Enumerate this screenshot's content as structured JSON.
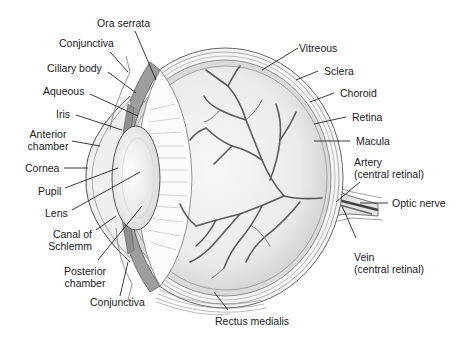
{
  "diagram": {
    "labels_left": {
      "ora_serrata": "Ora serrata",
      "conjunctiva_top": "Conjunctiva",
      "ciliary_body": "Ciliary body",
      "aqueous": "Aqueous",
      "iris": "Iris",
      "anterior_chamber_1": "Anterior",
      "anterior_chamber_2": "chamber",
      "cornea": "Cornea",
      "pupil": "Pupil",
      "lens": "Lens",
      "canal_1": "Canal of",
      "canal_2": "Schlemm",
      "posterior_chamber_1": "Posterior",
      "posterior_chamber_2": "chamber",
      "conjunctiva_bottom": "Conjunctiva"
    },
    "labels_right": {
      "vitreous": "Vitreous",
      "sclera": "Sclera",
      "choroid": "Choroid",
      "retina": "Retina",
      "macula": "Macula",
      "artery_1": "Artery",
      "artery_2": "(central retinal)",
      "optic_nerve": "Optic nerve",
      "vein_1": "Vein",
      "vein_2": "(central retinal)"
    },
    "labels_bottom": {
      "rectus_medialis": "Rectus medialis"
    },
    "colors": {
      "line": "#2a2a2a",
      "sclera_fill": "#f2f2f2",
      "choroid_fill": "#d6d6d6",
      "retina_fill": "#c8c8c8",
      "vitreous_fill": "#ececec",
      "vessel": "#555555",
      "ciliary_fill": "#9a9a9a"
    }
  }
}
